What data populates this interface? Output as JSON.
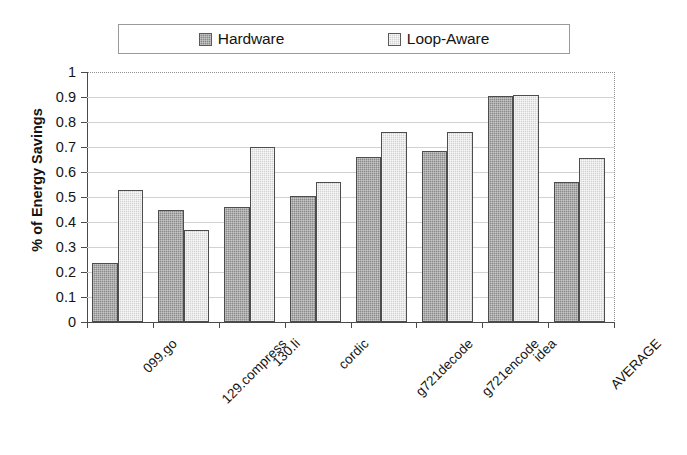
{
  "chart_data": {
    "type": "bar",
    "title": "",
    "xlabel": "",
    "ylabel": "% of Energy Savings",
    "ylim": [
      0,
      1
    ],
    "ytick_labels": [
      "0",
      "0.1",
      "0.2",
      "0.3",
      "0.4",
      "0.5",
      "0.6",
      "0.7",
      "0.8",
      "0.9",
      "1"
    ],
    "ytick_values": [
      0,
      0.1,
      0.2,
      0.3,
      0.4,
      0.5,
      0.6,
      0.7,
      0.8,
      0.9,
      1
    ],
    "grid": true,
    "legend_position": "top",
    "categories": [
      "099.go",
      "129.compress",
      "130.li",
      "cordic",
      "g721decode",
      "g721encode",
      "idea",
      "AVERAGE"
    ],
    "series": [
      {
        "name": "Hardware",
        "color": "#8a8a8a",
        "values": [
          0.235,
          0.45,
          0.46,
          0.505,
          0.66,
          0.685,
          0.905,
          0.56
        ]
      },
      {
        "name": "Loop-Aware",
        "color": "#d2d2d2",
        "values": [
          0.53,
          0.37,
          0.7,
          0.56,
          0.76,
          0.76,
          0.91,
          0.655
        ]
      }
    ]
  },
  "legend": {
    "entries": [
      {
        "label": "Hardware",
        "swatch": "hardware-swatch"
      },
      {
        "label": "Loop-Aware",
        "swatch": "loop-aware-swatch"
      }
    ]
  },
  "axes": {
    "y_title": "% of Energy Savings"
  }
}
